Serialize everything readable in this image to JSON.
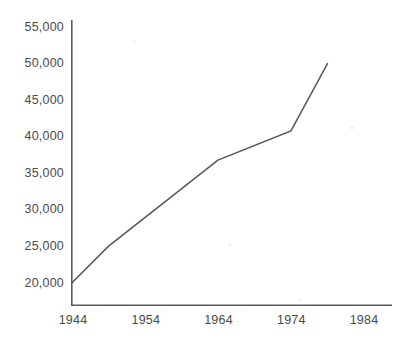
{
  "chart_data": {
    "type": "line",
    "title": "",
    "subtitle": "",
    "xlabel": "",
    "ylabel": "",
    "grid": false,
    "legend": false,
    "x": [
      1944,
      1949,
      1964,
      1974,
      1979
    ],
    "values": [
      20000,
      25000,
      36800,
      40800,
      50000
    ],
    "series": [
      {
        "name": "",
        "x": [
          1944,
          1949,
          1964,
          1974,
          1979
        ],
        "values": [
          20000,
          25000,
          36800,
          40800,
          50000
        ]
      }
    ],
    "xlim": [
      1944,
      1988
    ],
    "ylim": [
      20000,
      55000
    ],
    "xticks": [
      1944,
      1954,
      1964,
      1974,
      1984
    ],
    "xticklabels": [
      "1944",
      "1954",
      "1964",
      "1974",
      "1984"
    ],
    "yticks": [
      20000,
      25000,
      30000,
      35000,
      40000,
      45000,
      50000,
      55000
    ],
    "yticklabels": [
      "20,000",
      "25,000",
      "30,000",
      "35,000",
      "40,000",
      "45,000",
      "50,000",
      "55,000"
    ],
    "line_color": "#55555a",
    "axis_color": "#5b5b5b",
    "background_color": "#ffffff",
    "text_color": "#4a4a4a"
  },
  "axes": {
    "y_tick_labels": [
      {
        "text": "55,000",
        "value": 55000,
        "y": 27
      },
      {
        "text": "50,000",
        "value": 50000,
        "y": 63.6
      },
      {
        "text": "45,000",
        "value": 45000,
        "y": 100.1
      },
      {
        "text": "40,000",
        "value": 40000,
        "y": 136.7
      },
      {
        "text": "35,000",
        "value": 35000,
        "y": 173.3
      },
      {
        "text": "30,000",
        "value": 30000,
        "y": 209.9
      },
      {
        "text": "25,000",
        "value": 25000,
        "y": 246.4
      },
      {
        "text": "20,000",
        "value": 20000,
        "y": 283
      }
    ],
    "x_tick_labels": [
      {
        "text": "1944",
        "value": 1944,
        "x": 73
      },
      {
        "text": "1954",
        "value": 1954,
        "x": 145.8
      },
      {
        "text": "1964",
        "value": 1964,
        "x": 218.5
      },
      {
        "text": "1974",
        "value": 1974,
        "x": 291.3
      },
      {
        "text": "1984",
        "value": 1984,
        "x": 364
      }
    ]
  }
}
